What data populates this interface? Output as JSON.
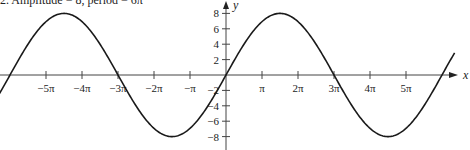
{
  "chart_data": {
    "type": "line",
    "title": "2. Amplitude = 8, period = 6π",
    "xlabel": "x",
    "ylabel": "y",
    "function": "y = 8 sin(x/3)",
    "amplitude": 8,
    "period": "6π",
    "x_ticks": [
      "−5π",
      "−4π",
      "−3π",
      "−2π",
      "−π",
      "π",
      "2π",
      "3π",
      "4π",
      "5π"
    ],
    "x_tick_values": [
      -5,
      -4,
      -3,
      -2,
      -1,
      1,
      2,
      3,
      4,
      5
    ],
    "y_ticks": [
      "8",
      "6",
      "4",
      "2",
      "−2",
      "−4",
      "−6",
      "−8"
    ],
    "y_tick_values": [
      8,
      6,
      4,
      2,
      -2,
      -4,
      -6,
      -8
    ],
    "xlim_pi": [
      -6.3,
      6.6
    ],
    "ylim": [
      -9,
      9
    ],
    "series": [
      {
        "name": "y = 8 sin(x/3)",
        "x_pi": [
          -6,
          -4.5,
          -3,
          -1.5,
          0,
          1.5,
          3,
          4.5,
          6
        ],
        "values": [
          0,
          8,
          0,
          -8,
          0,
          8,
          0,
          -8,
          0
        ]
      }
    ],
    "grid": false,
    "legend": "none"
  },
  "labels": {
    "title": "2. Amplitude = 8, period = 6π",
    "x_axis": "x",
    "y_axis": "y"
  }
}
